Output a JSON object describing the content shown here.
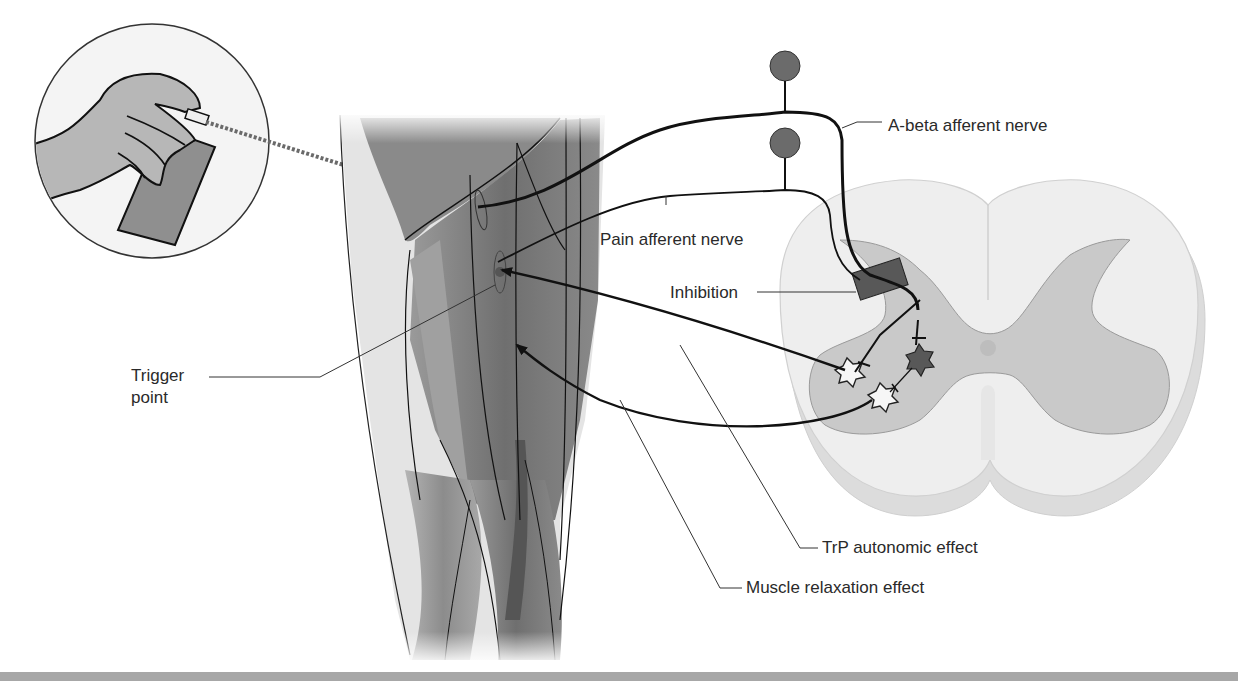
{
  "figure": {
    "components": {
      "inset": "hand-with-vapocoolant-spray",
      "limb": "thigh-muscles",
      "spinal_cord": "spinal-cord-cross-section"
    }
  },
  "labels": {
    "abeta": "A-beta afferent nerve",
    "pain": "Pain afferent nerve",
    "inhibition": "Inhibition",
    "trigger_line1": "Trigger",
    "trigger_line2": "point",
    "trp": "TrP autonomic effect",
    "muscle": "Muscle relaxation effect"
  },
  "colors": {
    "background": "#ffffff",
    "line": "#111111",
    "neuron_body": "#6b6b6b",
    "white_matter": "#ececec",
    "gray_matter": "#c9c9c9",
    "muscle_dark": "#7d7d7d",
    "muscle_light": "#bdbdbd",
    "footer_bar": "#a7a7a7"
  }
}
